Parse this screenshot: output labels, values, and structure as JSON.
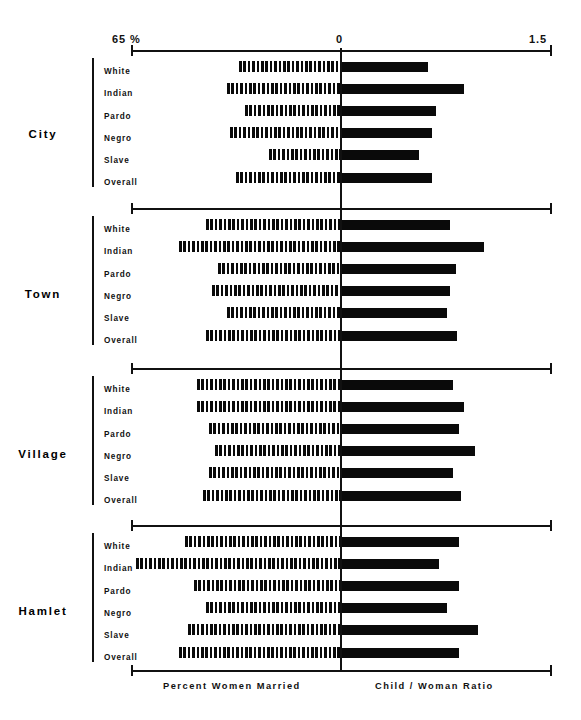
{
  "axis": {
    "left_label": "65 %",
    "zero_label": "0",
    "right_label": "1.5",
    "left_value": 65,
    "zero_value": 100,
    "right_value": 1.5
  },
  "footer": {
    "left_caption": "Percent  Women  Married",
    "right_caption": "Child / Woman  Ratio"
  },
  "chart_data": {
    "type": "bar",
    "title": "",
    "subtype": "bidirectional-paired-bar",
    "categories": [
      "White",
      "Indian",
      "Pardo",
      "Negro",
      "Slave",
      "Overall"
    ],
    "groups": [
      "City",
      "Town",
      "Village",
      "Hamlet"
    ],
    "xlabel_left": "Percent  Women  Married",
    "xlabel_right": "Child / Woman  Ratio",
    "xlim_left": [
      65,
      100
    ],
    "xlim_right": [
      0,
      1.5
    ],
    "grid": false,
    "legend": "none",
    "series": [
      {
        "name": "Percent Women Married",
        "direction": "left",
        "style": "hatched",
        "axis": "left",
        "units": "%",
        "values": {
          "City": [
            83.0,
            81.0,
            84.0,
            81.5,
            88.0,
            82.5
          ],
          "Town": [
            77.5,
            73.0,
            79.5,
            78.5,
            81.0,
            77.5
          ],
          "Village": [
            76.0,
            76.0,
            78.0,
            79.0,
            78.0,
            77.0
          ],
          "Hamlet": [
            74.0,
            65.8,
            75.5,
            77.5,
            74.5,
            73.0
          ]
        }
      },
      {
        "name": "Child / Woman Ratio",
        "direction": "right",
        "style": "solid",
        "axis": "right",
        "units": "ratio",
        "values": {
          "City": [
            0.62,
            0.88,
            0.68,
            0.65,
            0.56,
            0.65
          ],
          "Town": [
            0.78,
            1.02,
            0.82,
            0.78,
            0.76,
            0.83
          ],
          "Village": [
            0.8,
            0.88,
            0.84,
            0.96,
            0.8,
            0.86
          ],
          "Hamlet": [
            0.84,
            0.7,
            0.84,
            0.76,
            0.98,
            0.84
          ]
        }
      }
    ]
  },
  "geometry": {
    "axis_left_px": 131,
    "axis_zero_px": 341,
    "axis_right_px": 551,
    "row_height": 22.2,
    "bar_height": 11,
    "group_tops": [
      60,
      218,
      378,
      535
    ],
    "group_title_tops": [
      128,
      288,
      448,
      605
    ]
  }
}
